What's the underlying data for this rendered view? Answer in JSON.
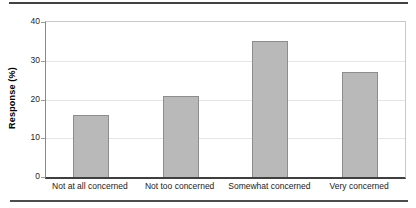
{
  "figure": {
    "top_rule_color": "#414141",
    "bottom_rule_color": "#4d4d4d"
  },
  "chart_data": {
    "type": "bar",
    "title": "",
    "xlabel": "",
    "ylabel": "Response (%)",
    "categories": [
      "Not at all concerned",
      "Not too concerned",
      "Somewhat concerned",
      "Very concerned"
    ],
    "values": [
      16,
      21,
      35,
      27
    ],
    "ylim": [
      0,
      40
    ],
    "yticks": [
      0,
      10,
      20,
      30,
      40
    ],
    "grid": true,
    "legend": "none",
    "bar_fill_color": "#b9b9b9",
    "bar_border_color": "#8d8d8d"
  }
}
